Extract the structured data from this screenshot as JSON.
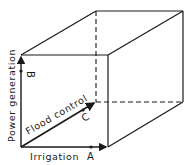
{
  "diagram": {
    "type": "3d-objective-space-cube",
    "axes": [
      {
        "id": "x",
        "label": "Irrigation",
        "point": "A"
      },
      {
        "id": "y",
        "label": "Power generation",
        "point": "B"
      },
      {
        "id": "z",
        "label": "Flood control",
        "point": "C"
      }
    ],
    "colors": {
      "line": "#1a1a1a",
      "background": "#ffffff"
    }
  }
}
